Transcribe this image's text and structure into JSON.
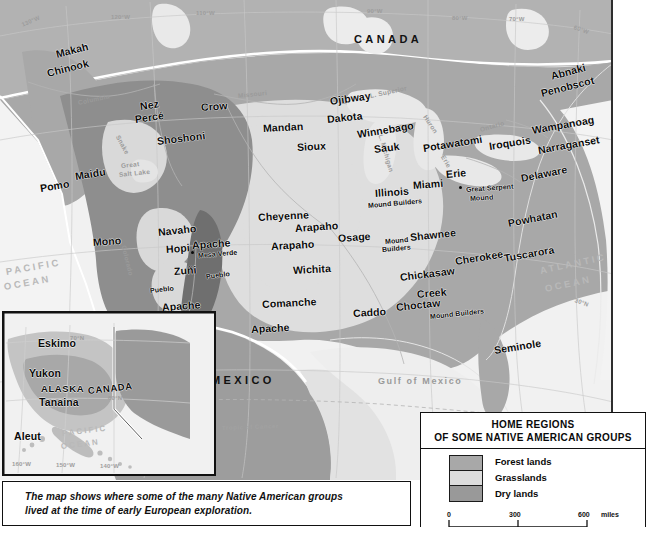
{
  "map": {
    "title_caption": [
      "The map shows where some of the many Native American groups",
      "lived at the time of early European exploration."
    ],
    "countries": [
      "CANADA",
      "MEXICO"
    ],
    "oceans": [
      "PACIFIC OCEAN",
      "ATLANTIC OCEAN",
      "Gulf of Mexico"
    ],
    "hydrography": [
      "Columbia",
      "Snake",
      "Missouri",
      "Great Salt Lake",
      "Colorado",
      "L. Superior",
      "L. Michigan",
      "Huron",
      "Erie",
      "Ontario"
    ],
    "graticule": [
      "130°W",
      "120°W",
      "110°W",
      "90°W",
      "80°W",
      "70°W",
      "60°W",
      "30°N",
      "20°N",
      "Tropic of Cancer"
    ],
    "sites": [
      "Mesa Verde",
      "Great Serpent Mound"
    ],
    "tribes": [
      "Makah",
      "Chinook",
      "Nez Percé",
      "Crow",
      "Shoshoni",
      "Mandan",
      "Ojibway",
      "Dakota",
      "Sioux",
      "Winnebago",
      "Sauk",
      "Potawatomi",
      "Iroquois",
      "Abnaki",
      "Penobscot",
      "Wampanoag",
      "Narraganset",
      "Erie",
      "Delaware",
      "Maidu",
      "Pomo",
      "Mono",
      "Navaho",
      "Hopi",
      "Apache",
      "Zuñi",
      "Pueblo",
      "Cheyenne",
      "Arapaho",
      "Osage",
      "Illinois",
      "Miami",
      "Shawnee",
      "Mound Builders",
      "Powhatan",
      "Wichita",
      "Cherokee",
      "Tuscarora",
      "Chickasaw",
      "Creek",
      "Comanche",
      "Caddo",
      "Choctaw",
      "Seminole"
    ]
  },
  "labels": [
    {
      "t": "Makah",
      "x": 56,
      "y": 48,
      "r": -14,
      "c": "tribe"
    },
    {
      "t": "Chinook",
      "x": 47,
      "y": 67,
      "r": -14,
      "c": "tribe"
    },
    {
      "t": "Nez",
      "x": 140,
      "y": 100,
      "r": -8,
      "c": "tribe"
    },
    {
      "t": "Percé",
      "x": 135,
      "y": 113,
      "r": -8,
      "c": "tribe"
    },
    {
      "t": "Crow",
      "x": 201,
      "y": 101,
      "r": -4,
      "c": "tribe"
    },
    {
      "t": "Shoshoni",
      "x": 157,
      "y": 135,
      "r": -7,
      "c": "tribe"
    },
    {
      "t": "Mandan",
      "x": 263,
      "y": 122,
      "r": -3,
      "c": "tribe"
    },
    {
      "t": "Sioux",
      "x": 297,
      "y": 141,
      "r": -3,
      "c": "tribe"
    },
    {
      "t": "Ojibway",
      "x": 330,
      "y": 95,
      "r": -8,
      "c": "tribe"
    },
    {
      "t": "Dakota",
      "x": 327,
      "y": 113,
      "r": -6,
      "c": "tribe"
    },
    {
      "t": "Winnebago",
      "x": 357,
      "y": 128,
      "r": -9,
      "c": "tribe"
    },
    {
      "t": "Sauk",
      "x": 374,
      "y": 143,
      "r": -7,
      "c": "tribe"
    },
    {
      "t": "Potawatomi",
      "x": 423,
      "y": 142,
      "r": -9,
      "c": "tribe"
    },
    {
      "t": "Iroquois",
      "x": 489,
      "y": 140,
      "r": -9,
      "c": "tribe"
    },
    {
      "t": "Abnaki",
      "x": 551,
      "y": 70,
      "r": -15,
      "c": "tribe"
    },
    {
      "t": "Penobscot",
      "x": 541,
      "y": 87,
      "r": -14,
      "c": "tribe"
    },
    {
      "t": "Wampanoag",
      "x": 532,
      "y": 124,
      "r": -10,
      "c": "tribe"
    },
    {
      "t": "Narraganset",
      "x": 538,
      "y": 144,
      "r": -10,
      "c": "tribe"
    },
    {
      "t": "Erie",
      "x": 446,
      "y": 168,
      "r": -5,
      "c": "tribe"
    },
    {
      "t": "Delaware",
      "x": 521,
      "y": 172,
      "r": -11,
      "c": "tribe"
    },
    {
      "t": "Illinois",
      "x": 375,
      "y": 187,
      "r": -4,
      "c": "tribe"
    },
    {
      "t": "Miami",
      "x": 413,
      "y": 179,
      "r": -4,
      "c": "tribe"
    },
    {
      "t": "Mound Builders",
      "x": 368,
      "y": 202,
      "r": -5,
      "c": "tribe-xs"
    },
    {
      "t": "Great Serpent",
      "x": 466,
      "y": 186,
      "r": -4,
      "c": "tribe-xs"
    },
    {
      "t": "Mound",
      "x": 470,
      "y": 195,
      "r": -4,
      "c": "tribe-xs"
    },
    {
      "t": "Maidu",
      "x": 75,
      "y": 170,
      "r": -9,
      "c": "tribe"
    },
    {
      "t": "Pomo",
      "x": 40,
      "y": 182,
      "r": -9,
      "c": "tribe"
    },
    {
      "t": "Mono",
      "x": 93,
      "y": 236,
      "r": -4,
      "c": "tribe"
    },
    {
      "t": "Navaho",
      "x": 158,
      "y": 226,
      "r": -6,
      "c": "tribe"
    },
    {
      "t": "Hopi",
      "x": 166,
      "y": 243,
      "r": -4,
      "c": "tribe"
    },
    {
      "t": "Apache",
      "x": 192,
      "y": 239,
      "r": -4,
      "c": "tribe"
    },
    {
      "t": "Mesa Verde",
      "x": 198,
      "y": 252,
      "r": -5,
      "c": "tribe-xs"
    },
    {
      "t": "Zuñi",
      "x": 174,
      "y": 265,
      "r": -4,
      "c": "tribe"
    },
    {
      "t": "Pueblo",
      "x": 206,
      "y": 273,
      "r": -7,
      "c": "tribe-xs"
    },
    {
      "t": "Pueblo",
      "x": 150,
      "y": 287,
      "r": -6,
      "c": "tribe-xs"
    },
    {
      "t": "Apache",
      "x": 162,
      "y": 301,
      "r": -4,
      "c": "tribe"
    },
    {
      "t": "Apache",
      "x": 251,
      "y": 323,
      "r": -3,
      "c": "tribe"
    },
    {
      "t": "Cheyenne",
      "x": 258,
      "y": 211,
      "r": -3,
      "c": "tribe"
    },
    {
      "t": "Arapaho",
      "x": 295,
      "y": 222,
      "r": -4,
      "c": "tribe"
    },
    {
      "t": "Arapaho",
      "x": 271,
      "y": 240,
      "r": -3,
      "c": "tribe"
    },
    {
      "t": "Osage",
      "x": 338,
      "y": 232,
      "r": -4,
      "c": "tribe"
    },
    {
      "t": "Mound",
      "x": 385,
      "y": 238,
      "r": -5,
      "c": "tribe-xs"
    },
    {
      "t": "Builders",
      "x": 382,
      "y": 246,
      "r": -5,
      "c": "tribe-xs"
    },
    {
      "t": "Shawnee",
      "x": 410,
      "y": 231,
      "r": -6,
      "c": "tribe"
    },
    {
      "t": "Mound",
      "x": 385,
      "y": 238,
      "r": -5,
      "c": "skip"
    },
    {
      "t": "Powhatan",
      "x": 508,
      "y": 217,
      "r": -11,
      "c": "tribe"
    },
    {
      "t": "Wichita",
      "x": 293,
      "y": 264,
      "r": -3,
      "c": "tribe"
    },
    {
      "t": "Cherokee",
      "x": 455,
      "y": 255,
      "r": -9,
      "c": "tribe"
    },
    {
      "t": "Tuscarora",
      "x": 504,
      "y": 252,
      "r": -10,
      "c": "tribe"
    },
    {
      "t": "Chickasaw",
      "x": 400,
      "y": 271,
      "r": -7,
      "c": "tribe"
    },
    {
      "t": "Creek",
      "x": 417,
      "y": 288,
      "r": -5,
      "c": "tribe"
    },
    {
      "t": "Comanche",
      "x": 262,
      "y": 298,
      "r": -3,
      "c": "tribe"
    },
    {
      "t": "Caddo",
      "x": 353,
      "y": 307,
      "r": -3,
      "c": "tribe"
    },
    {
      "t": "Choctaw",
      "x": 396,
      "y": 301,
      "r": -6,
      "c": "tribe"
    },
    {
      "t": "Mound Builders",
      "x": 430,
      "y": 313,
      "r": -6,
      "c": "tribe-xs"
    },
    {
      "t": "Seminole",
      "x": 494,
      "y": 344,
      "r": -9,
      "c": "tribe"
    }
  ],
  "alaska": {
    "labels": [
      {
        "t": "Eskimo",
        "x": 34,
        "y": 30,
        "c": "tribe"
      },
      {
        "t": "Yukon",
        "x": 26,
        "y": 61,
        "c": "tribe"
      },
      {
        "t": "ALASKA",
        "x": 38,
        "y": 77,
        "c": "tribe"
      },
      {
        "t": "Tanaina",
        "x": 36,
        "y": 90,
        "c": "tribe"
      },
      {
        "t": "CANADA",
        "x": 86,
        "y": 78,
        "c": "tribe"
      },
      {
        "t": "Aleut",
        "x": 12,
        "y": 124,
        "c": "tribe"
      }
    ],
    "ocean": "PACIFIC OCEAN",
    "graticule": [
      "160°W",
      "150°W",
      "140°W",
      "70°N",
      "60°N"
    ]
  },
  "legend": {
    "title_line1": "HOME REGIONS",
    "title_line2": "OF SOME NATIVE AMERICAN GROUPS",
    "items": [
      {
        "label": "Forest lands",
        "color": "#a8a8a8"
      },
      {
        "label": "Grasslands",
        "color": "#dcdcdc"
      },
      {
        "label": "Dry lands",
        "color": "#999999"
      }
    ],
    "scale_miles": {
      "ticks": [
        "0",
        "300",
        "600"
      ],
      "unit": "miles"
    },
    "scale_km": {
      "ticks": [
        "0",
        "300",
        "600"
      ],
      "unit": "kilometers"
    }
  },
  "colors": {
    "forest": "#a8a8a8",
    "grass": "#dcdcdc",
    "dry": "#8e8e8e",
    "ocean": "#f0f0f0",
    "canada": "#b0b0b0",
    "mexico": "#9f9f9f",
    "border": "#ffffff"
  }
}
